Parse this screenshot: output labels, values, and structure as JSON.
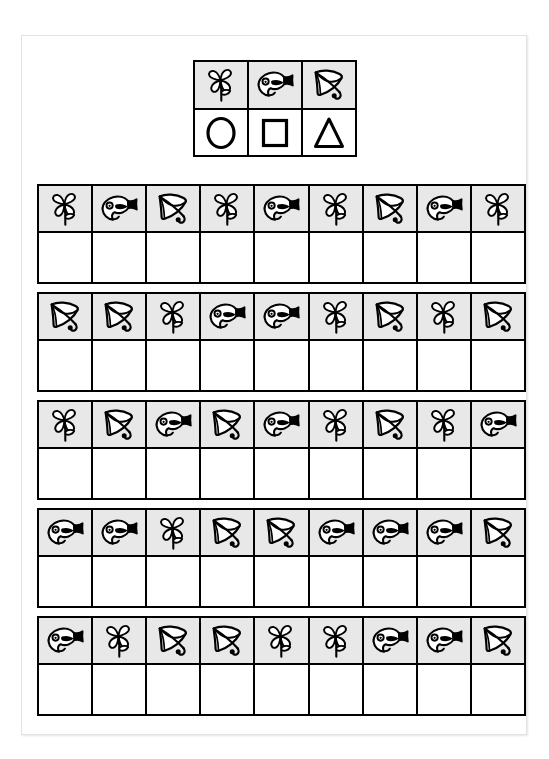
{
  "worksheet": {
    "page_label": "symbol-coding-worksheet",
    "icon_cell_color": "#e8e8e8",
    "cell_border_color": "#000000",
    "page_background": "#ffffff",
    "icon_names": {
      "clover": "clover-icon",
      "fish": "fish-icon",
      "umbrella": "umbrella-icon"
    },
    "shape_names": {
      "circle": "circle-shape-icon",
      "square": "square-shape-icon",
      "triangle": "triangle-shape-icon"
    }
  },
  "legend": {
    "name": "legend-key-table",
    "pairs": [
      {
        "icon": "clover",
        "shape": "circle"
      },
      {
        "icon": "fish",
        "shape": "square"
      },
      {
        "icon": "umbrella",
        "shape": "triangle"
      }
    ]
  },
  "exercise_rows": [
    {
      "index": 1,
      "icons": [
        "clover",
        "fish",
        "umbrella",
        "clover",
        "fish",
        "clover",
        "umbrella",
        "fish",
        "clover"
      ],
      "answers": [
        "",
        "",
        "",
        "",
        "",
        "",
        "",
        "",
        ""
      ]
    },
    {
      "index": 2,
      "icons": [
        "umbrella",
        "umbrella",
        "clover",
        "fish",
        "fish",
        "clover",
        "umbrella",
        "clover",
        "umbrella"
      ],
      "answers": [
        "",
        "",
        "",
        "",
        "",
        "",
        "",
        "",
        ""
      ]
    },
    {
      "index": 3,
      "icons": [
        "clover",
        "umbrella",
        "fish",
        "umbrella",
        "fish",
        "clover",
        "umbrella",
        "clover",
        "fish"
      ],
      "answers": [
        "",
        "",
        "",
        "",
        "",
        "",
        "",
        "",
        ""
      ]
    },
    {
      "index": 4,
      "icons": [
        "fish",
        "fish",
        "clover",
        "umbrella",
        "umbrella",
        "fish",
        "fish",
        "fish",
        "umbrella"
      ],
      "answers": [
        "",
        "",
        "",
        "",
        "",
        "",
        "",
        "",
        ""
      ]
    },
    {
      "index": 5,
      "icons": [
        "fish",
        "clover",
        "umbrella",
        "umbrella",
        "clover",
        "clover",
        "fish",
        "fish",
        "umbrella"
      ],
      "answers": [
        "",
        "",
        "",
        "",
        "",
        "",
        "",
        "",
        ""
      ]
    }
  ]
}
